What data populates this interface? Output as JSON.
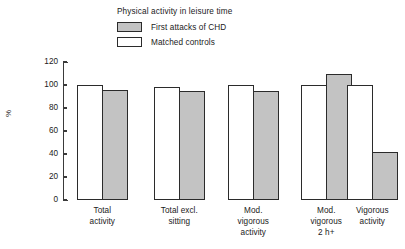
{
  "chart_data": {
    "type": "bar",
    "title": "",
    "legend_title": "Physical activity in leisure time",
    "legend_position": "top-center",
    "xlabel": "",
    "ylabel": "%",
    "ylim": [
      0,
      120
    ],
    "yticks": [
      0,
      20,
      40,
      60,
      80,
      100,
      120
    ],
    "grid": false,
    "categories": [
      "Total\nactivity",
      "Total excl.\nsitting",
      "Mod.\nvigorous\nactivity",
      "Mod.\nvigorous\n2 h+",
      "Vigorous\nactivity"
    ],
    "series": [
      {
        "name": "Matched controls",
        "color": "#ffffff",
        "values": [
          100,
          98,
          100,
          100,
          100
        ]
      },
      {
        "name": "First attacks of CHD",
        "color": "#c3c3c3",
        "values": [
          96,
          95,
          95,
          110,
          42
        ]
      }
    ]
  },
  "legend": {
    "title": "Physical activity in leisure time",
    "entries": [
      {
        "label": "First attacks of CHD",
        "swatch": "filled"
      },
      {
        "label": "Matched controls",
        "swatch": "empty"
      }
    ]
  },
  "axis": {
    "y_label": "%",
    "y_tick_labels": [
      "120",
      "100",
      "80",
      "60",
      "40",
      "20",
      "0"
    ]
  },
  "colors": {
    "case_fill": "#c3c3c3",
    "control_fill": "#ffffff",
    "outline": "#2b2b2b",
    "axis": "#3a3a3a",
    "text": "#1a1a1a",
    "background": "#ffffff"
  }
}
